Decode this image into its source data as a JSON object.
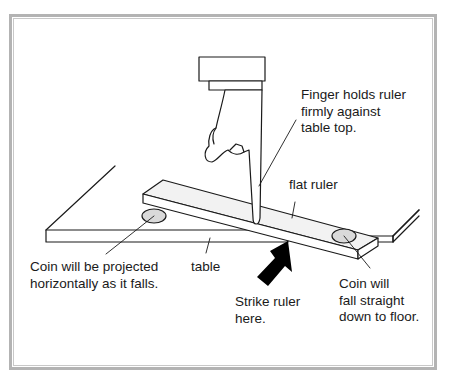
{
  "diagram": {
    "labels": {
      "finger": [
        "Finger holds ruler",
        "firmly against",
        "table top."
      ],
      "flat_ruler": "flat ruler",
      "coin_left": [
        "Coin will be projected",
        "horizontally as it falls."
      ],
      "table": "table",
      "strike": [
        "Strike ruler",
        "here."
      ],
      "coin_right": [
        "Coin will",
        "fall straight",
        "down to floor."
      ]
    },
    "colors": {
      "line": "#1a1a1a",
      "ruler_fill": "#f2f2f2",
      "coin_fill": "#d9d9d9",
      "arrow_fill": "#000000",
      "frame": "#b3b3b3"
    }
  }
}
